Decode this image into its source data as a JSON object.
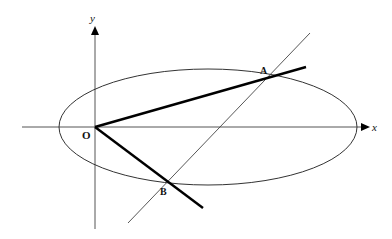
{
  "diagram": {
    "title": "",
    "axes": {
      "x_label": "x",
      "y_label": "y",
      "origin_label": "O"
    },
    "points": [
      {
        "name": "A",
        "label": "A"
      },
      {
        "name": "B",
        "label": "B"
      }
    ],
    "shapes": {
      "ellipse": {
        "description": "ellipse centered on x-axis, passing through A and B"
      },
      "chord": {
        "description": "thin line through A and B"
      },
      "segments": [
        "OA",
        "OB"
      ]
    },
    "colors": {
      "line": "#222222",
      "thick": "#000000"
    }
  }
}
